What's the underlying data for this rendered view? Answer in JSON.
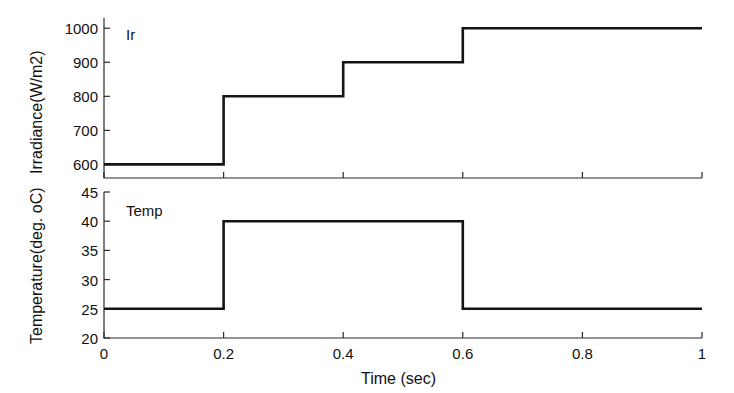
{
  "figure": {
    "background": "#ffffff",
    "line_color": "#141414",
    "axis_color": "#2b2b2b"
  },
  "chart_data": [
    {
      "type": "line",
      "subplot": "top",
      "title": "",
      "annotation": "Ir",
      "xlabel": "",
      "ylabel": "Irradiance(W/m2)",
      "xlim": [
        0,
        1
      ],
      "ylim": [
        560,
        1030
      ],
      "xticks": [
        0,
        0.2,
        0.4,
        0.6,
        0.8,
        1
      ],
      "xticklabels": [
        "0",
        "0.2",
        "0.4",
        "0.6",
        "0.8",
        "1"
      ],
      "yticks": [
        600,
        700,
        800,
        900,
        1000
      ],
      "yticklabels": [
        "600",
        "700",
        "800",
        "900",
        "1000"
      ],
      "grid": false,
      "drawstyle": "steps-post",
      "x": [
        0,
        0.2,
        0.4,
        0.6,
        1.0
      ],
      "values": [
        600,
        800,
        900,
        1000,
        1000
      ],
      "series_name": "Ir",
      "units": "W/m2"
    },
    {
      "type": "line",
      "subplot": "bottom",
      "title": "",
      "annotation": "Temp",
      "xlabel": "Time (sec)",
      "ylabel": "Temperature(deg. oC)",
      "xlim": [
        0,
        1
      ],
      "ylim": [
        20,
        45
      ],
      "xticks": [
        0,
        0.2,
        0.4,
        0.6,
        0.8,
        1
      ],
      "xticklabels": [
        "0",
        "0.2",
        "0.4",
        "0.6",
        "0.8",
        "1"
      ],
      "yticks": [
        20,
        25,
        30,
        35,
        40,
        45
      ],
      "yticklabels": [
        "20",
        "25",
        "30",
        "35",
        "40",
        "45"
      ],
      "grid": false,
      "drawstyle": "steps-post",
      "x": [
        0,
        0.2,
        0.6,
        1.0
      ],
      "values": [
        25,
        40,
        25,
        25
      ],
      "series_name": "Temp",
      "units": "deg. oC"
    }
  ]
}
